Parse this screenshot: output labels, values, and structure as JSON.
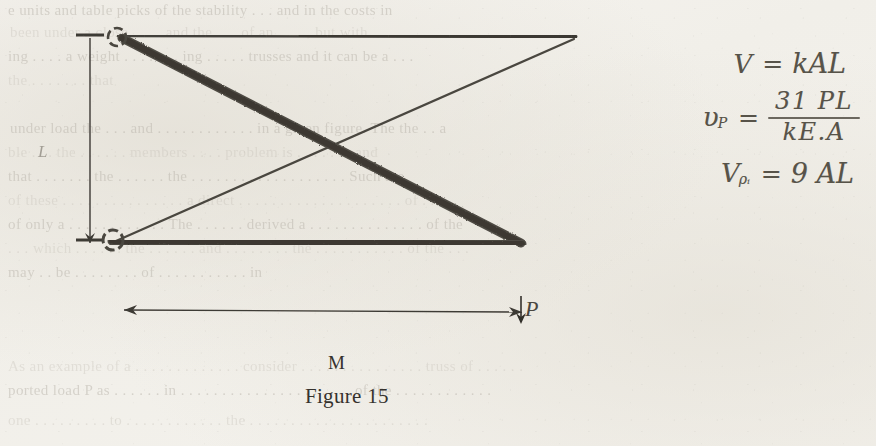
{
  "page": {
    "width": 876,
    "height": 446,
    "background_color": "#f3f1ec",
    "ink_color": "#35322d",
    "pencil_color": "#5e5a53"
  },
  "figure": {
    "caption": "Figure 15",
    "span_label": "M",
    "load_label": "P",
    "height_label": "L",
    "members": [
      {
        "name": "top-chord",
        "weight": "thin",
        "from": [
          118,
          36
        ],
        "to": [
          575,
          36
        ]
      },
      {
        "name": "bottom-chord",
        "weight": "thick",
        "from": [
          112,
          240
        ],
        "to": [
          520,
          243
        ]
      },
      {
        "name": "main-diagonal",
        "weight": "thick",
        "from": [
          120,
          36
        ],
        "to": [
          520,
          243
        ]
      },
      {
        "name": "counter-diagonal",
        "weight": "thin",
        "from": [
          112,
          240
        ],
        "to": [
          575,
          36
        ]
      }
    ],
    "joints": [
      {
        "name": "upper-left-pin",
        "cx": 117,
        "cy": 37,
        "r": 9
      },
      {
        "name": "lower-left-pin",
        "cx": 113,
        "cy": 240,
        "r": 10
      }
    ],
    "dimension_lines": [
      {
        "name": "vertical-height-dimension",
        "orientation": "vertical",
        "x": 90,
        "from_y": 34,
        "to_y": 244
      },
      {
        "name": "horizontal-span-dimension",
        "orientation": "horizontal",
        "y": 310,
        "from_x": 124,
        "to_x": 522
      }
    ],
    "load_arrow": {
      "name": "point-load-arrow",
      "x": 521,
      "from_y": 248,
      "to_y": 318,
      "direction": "down"
    }
  },
  "equations": [
    {
      "id": "volume",
      "lhs": "V",
      "subscript": "",
      "relation": "=",
      "rhs_plain": "kAL",
      "is_fraction": false
    },
    {
      "id": "deflection",
      "lhs": "υ",
      "subscript": "P",
      "relation": "=",
      "numerator": "31 PL",
      "denominator": "kE.A",
      "is_fraction": true
    },
    {
      "id": "volume-min",
      "lhs": "V",
      "subscript": "ρᵢ",
      "relation": "=",
      "rhs_plain": "9 AL",
      "is_fraction": false
    }
  ],
  "bleed_through_text": [
    {
      "text": "e  units  and   table  picks  of  the   stability  . . .  and  in   the  costs  in",
      "x": 8,
      "y": 2,
      "size": 15,
      "faded": false
    },
    {
      "text": "been  under  a  close  .   .   .   .  and  the  .   . .  of  an  .  .  .  ., but  with",
      "x": 10,
      "y": 24,
      "size": 15,
      "faded": true
    },
    {
      "text": "ing  .  .  .  . a  weight  . . . . . . .  ing  . . . . .  trusses  and  it  can  be  a  . .  .",
      "x": 8,
      "y": 48,
      "size": 15,
      "faded": false
    },
    {
      "text": "the  . . . . . . .  that",
      "x": 8,
      "y": 72,
      "size": 15,
      "faded": true
    },
    {
      "text": "under  load  the  . . .  and  . . . . . .  . . . . . .  in  a  given  figure.  The  the  .  . a",
      "x": 10,
      "y": 120,
      "size": 15,
      "faded": false
    },
    {
      "text": "ble  .  . .  the  .  . . . . .  members  .  . . .  problem  is  .  . .  .  . . .  and",
      "x": 8,
      "y": 144,
      "size": 15,
      "faded": true
    },
    {
      "text": "that  .  . . . . . .  the  .  . . . . .  the  .  .  . . . . . . .  . . . . . .  .  . . .  Such  are",
      "x": 8,
      "y": 168,
      "size": 15,
      "faded": false
    },
    {
      "text": "of  these  .  . . . . . . .  . . . . .  . .  a  direct  .  . . . . .  .  . . . . . . .  . . . . . .  of  .  . .",
      "x": 8,
      "y": 192,
      "size": 15,
      "faded": true
    },
    {
      "text": "of  only  a  . . . . . . .  . . . . .  The  . . . . . .  derived  a  . . . . .  . . . . . . . . .  of  the",
      "x": 8,
      "y": 216,
      "size": 15,
      "faded": false
    },
    {
      "text": ".  . .  which  . . . . . .  the  . . . . . .  and  . .  . . . . . .  the  . . . . . .  . . . . .  of  the  . . .",
      "x": 8,
      "y": 240,
      "size": 15,
      "faded": true
    },
    {
      "text": "may  .  .  be  .  . . . .  . . .  of  .  . . . . . .  .  . . .  in",
      "x": 8,
      "y": 264,
      "size": 15,
      "faded": false
    },
    {
      "text": "As  an  example  of  a  . . . . . . .  . . . . . .  consider  . . . . . . .  . . . . . . . .  truss  of  .  . .  . . .",
      "x": 8,
      "y": 358,
      "size": 15,
      "faded": true
    },
    {
      "text": "ported  load  P  as  . . . . . .  in  . . . . . . .  .  . . . . .  . . . . . . . .  of  the  .  . . .  . . . . .  . . .",
      "x": 8,
      "y": 382,
      "size": 15,
      "faded": false
    },
    {
      "text": "one  . . . . .  .  . . .  to  . . . . . .  . . . . . .  the  .  . . . . . .  .  . . . . . .  .  . . .  . . . .",
      "x": 8,
      "y": 412,
      "size": 15,
      "faded": true
    }
  ]
}
